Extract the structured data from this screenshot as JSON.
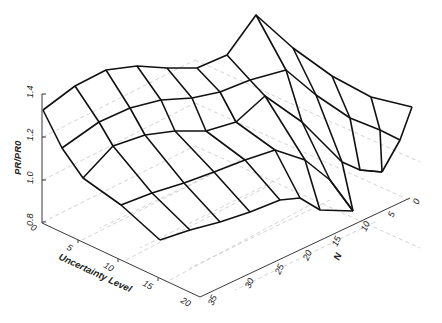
{
  "chart_data": {
    "type": "surface3d",
    "title": "",
    "zlabel": "PR/PR0",
    "xlabel": "Uncertainty Level",
    "ylabel": "N",
    "z_ticks": [
      "0.8",
      "1.0",
      "1.2",
      "1.4"
    ],
    "x_ticks": [
      "0",
      "5",
      "10",
      "15",
      "20"
    ],
    "y_ticks": [
      "0",
      "5",
      "10",
      "15",
      "20",
      "25",
      "30",
      "35"
    ],
    "zlim": [
      0.8,
      1.4
    ],
    "xlim": [
      0,
      20
    ],
    "ylim": [
      0,
      35
    ],
    "grid": true,
    "mesh_rows_px": [
      [
        [
          43,
          110
        ],
        [
          75,
          86
        ],
        [
          106,
          70
        ],
        [
          137,
          66
        ],
        [
          167,
          68
        ],
        [
          197,
          68
        ],
        [
          227,
          55
        ],
        [
          256,
          15
        ],
        [
          293,
          48
        ],
        [
          332,
          76
        ],
        [
          371,
          97
        ],
        [
          412,
          107
        ]
      ],
      [
        [
          62,
          148
        ],
        [
          99,
          122
        ],
        [
          130,
          108
        ],
        [
          161,
          100
        ],
        [
          192,
          98
        ],
        [
          220,
          92
        ],
        [
          250,
          80
        ],
        [
          286,
          70
        ],
        [
          316,
          95
        ],
        [
          350,
          118
        ],
        [
          380,
          130
        ],
        [
          400,
          140
        ]
      ],
      [
        [
          83,
          178
        ],
        [
          113,
          146
        ],
        [
          145,
          135
        ],
        [
          175,
          131
        ],
        [
          206,
          131
        ],
        [
          236,
          122
        ],
        [
          265,
          96
        ],
        [
          302,
          122
        ],
        [
          342,
          162
        ],
        [
          360,
          170
        ],
        [
          382,
          172
        ],
        [
          382,
          172
        ]
      ],
      [
        [
          121,
          205
        ],
        [
          152,
          193
        ],
        [
          184,
          183
        ],
        [
          214,
          172
        ],
        [
          245,
          160
        ],
        [
          275,
          150
        ],
        [
          305,
          160
        ],
        [
          330,
          180
        ],
        [
          353,
          211
        ],
        [
          353,
          211
        ],
        [
          353,
          211
        ],
        [
          353,
          211
        ]
      ],
      [
        [
          160,
          240
        ],
        [
          190,
          230
        ],
        [
          220,
          222
        ],
        [
          250,
          212
        ],
        [
          280,
          200
        ],
        [
          300,
          198
        ],
        [
          320,
          210
        ],
        [
          353,
          211
        ],
        [
          353,
          211
        ],
        [
          353,
          211
        ],
        [
          353,
          211
        ],
        [
          353,
          211
        ]
      ]
    ],
    "mesh_cols_px": [
      [
        [
          43,
          110
        ],
        [
          62,
          148
        ],
        [
          83,
          178
        ],
        [
          121,
          205
        ],
        [
          160,
          240
        ]
      ],
      [
        [
          75,
          86
        ],
        [
          99,
          122
        ],
        [
          113,
          146
        ],
        [
          152,
          193
        ],
        [
          190,
          230
        ]
      ],
      [
        [
          106,
          70
        ],
        [
          130,
          108
        ],
        [
          145,
          135
        ],
        [
          184,
          183
        ],
        [
          220,
          222
        ]
      ],
      [
        [
          137,
          66
        ],
        [
          161,
          100
        ],
        [
          175,
          131
        ],
        [
          214,
          172
        ],
        [
          250,
          212
        ]
      ],
      [
        [
          167,
          68
        ],
        [
          192,
          98
        ],
        [
          206,
          131
        ],
        [
          245,
          160
        ],
        [
          280,
          200
        ]
      ],
      [
        [
          197,
          68
        ],
        [
          220,
          92
        ],
        [
          236,
          122
        ],
        [
          275,
          150
        ],
        [
          300,
          198
        ]
      ],
      [
        [
          227,
          55
        ],
        [
          250,
          80
        ],
        [
          265,
          96
        ],
        [
          305,
          160
        ],
        [
          320,
          210
        ]
      ],
      [
        [
          256,
          15
        ],
        [
          286,
          70
        ],
        [
          302,
          122
        ],
        [
          330,
          180
        ],
        [
          353,
          211
        ]
      ],
      [
        [
          293,
          48
        ],
        [
          316,
          95
        ],
        [
          342,
          162
        ],
        [
          353,
          211
        ]
      ],
      [
        [
          332,
          76
        ],
        [
          350,
          118
        ],
        [
          360,
          170
        ],
        [
          382,
          172
        ]
      ],
      [
        [
          371,
          97
        ],
        [
          380,
          130
        ],
        [
          382,
          172
        ]
      ],
      [
        [
          412,
          107
        ],
        [
          400,
          140
        ],
        [
          382,
          172
        ]
      ]
    ]
  },
  "axes": {
    "z_axis": {
      "label": "PR/PR0",
      "ticks": [
        "0.8",
        "1.0",
        "1.2",
        "1.4"
      ]
    },
    "x_axis": {
      "label": "Uncertainty Level",
      "ticks": [
        "0",
        "5",
        "10",
        "15",
        "20"
      ]
    },
    "y_axis": {
      "label": "N",
      "ticks": [
        "0",
        "5",
        "10",
        "15",
        "20",
        "25",
        "30",
        "35"
      ]
    }
  }
}
